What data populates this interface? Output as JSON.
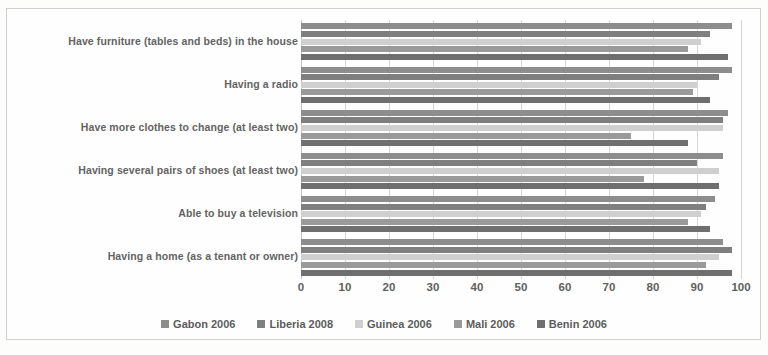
{
  "chart_data": {
    "type": "bar",
    "orientation": "horizontal",
    "title": "",
    "subtitle": "",
    "xlabel": "",
    "ylabel": "",
    "xlim": [
      0,
      100
    ],
    "xticks": [
      0,
      10,
      20,
      30,
      40,
      50,
      60,
      70,
      80,
      90,
      100
    ],
    "grid": true,
    "legend_position": "bottom",
    "categories": [
      "Have furniture (tables and beds) in the house",
      "Having a radio",
      "Have more clothes to change (at least two)",
      "Having several pairs of shoes (at least two)",
      "Able to buy a television",
      "Having a home (as a tenant or owner)"
    ],
    "series": [
      {
        "name": "Gabon 2006",
        "color": "#8d8d8d",
        "values": [
          98,
          98,
          97,
          96,
          94,
          96
        ]
      },
      {
        "name": "Liberia 2008",
        "color": "#7f7f7f",
        "values": [
          93,
          95,
          96,
          90,
          92,
          98
        ]
      },
      {
        "name": "Guinea 2006",
        "color": "#cfcfcf",
        "values": [
          91,
          90,
          96,
          95,
          91,
          95
        ]
      },
      {
        "name": "Mali 2006",
        "color": "#9a9a9a",
        "values": [
          88,
          89,
          75,
          78,
          88,
          92
        ]
      },
      {
        "name": "Benin 2006",
        "color": "#6f6f6f",
        "values": [
          97,
          93,
          88,
          95,
          93,
          98
        ]
      }
    ]
  },
  "axis": {
    "tick_labels": [
      "0",
      "10",
      "20",
      "30",
      "40",
      "50",
      "60",
      "70",
      "80",
      "90",
      "100"
    ]
  },
  "legend": {
    "items": [
      {
        "label": "Gabon 2006",
        "color": "#8d8d8d"
      },
      {
        "label": "Liberia 2008",
        "color": "#7f7f7f"
      },
      {
        "label": "Guinea 2006",
        "color": "#cfcfcf"
      },
      {
        "label": "Mali 2006",
        "color": "#9a9a9a"
      },
      {
        "label": "Benin 2006",
        "color": "#6f6f6f"
      }
    ]
  }
}
